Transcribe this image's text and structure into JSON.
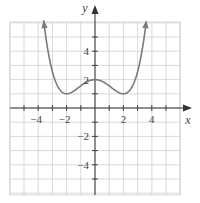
{
  "chart_data": {
    "type": "line",
    "title": "",
    "xlabel": "x",
    "ylabel": "y",
    "xlim": [
      -6,
      6
    ],
    "ylim": [
      -6,
      6
    ],
    "grid": true,
    "x_tick_labels": [
      "-4",
      "-2",
      "2",
      "4"
    ],
    "y_tick_labels": [
      "4",
      "2",
      "-2",
      "-4"
    ],
    "series": [
      {
        "name": "f(x)",
        "description": "Even function with local max at (0,2), local minima near (-2,1) and (2,1), rising to arrows at top near x=±3.5",
        "x": [
          -3.5,
          -3.0,
          -2.5,
          -2.0,
          -1.5,
          -1.0,
          -0.5,
          0,
          0.5,
          1.0,
          1.5,
          2.0,
          2.5,
          3.0,
          3.5
        ],
        "y": [
          6.5,
          3.3,
          1.6,
          1.0,
          1.2,
          1.6,
          1.9,
          2.0,
          1.9,
          1.6,
          1.2,
          1.0,
          1.6,
          3.3,
          6.5
        ]
      }
    ],
    "colors": {
      "curve": "#7a7a7a",
      "axis": "#333333",
      "grid": "#cfcfcf"
    }
  }
}
